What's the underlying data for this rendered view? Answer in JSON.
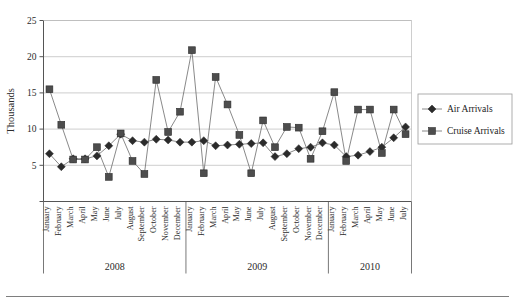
{
  "chart_data": {
    "type": "line",
    "title": "",
    "subtitle": "",
    "xlabel": "",
    "ylabel": "Thousands",
    "ylim": [
      0,
      25
    ],
    "yticks": [
      0,
      5,
      10,
      15,
      20,
      25
    ],
    "ytick_labels": [
      "",
      "5",
      "10",
      "15",
      "20",
      "25"
    ],
    "grid": true,
    "legend_position": "right",
    "x": [
      "January",
      "February",
      "March",
      "April",
      "May",
      "June",
      "July",
      "August",
      "September",
      "October",
      "November",
      "December",
      "January",
      "February",
      "March",
      "April",
      "May",
      "June",
      "July",
      "August",
      "September",
      "October",
      "November",
      "December",
      "January",
      "February",
      "March",
      "April",
      "May",
      "June",
      "July"
    ],
    "year_groups": [
      {
        "label": "2008",
        "start_index": 0,
        "count": 12
      },
      {
        "label": "2009",
        "start_index": 12,
        "count": 12
      },
      {
        "label": "2010",
        "start_index": 24,
        "count": 7
      }
    ],
    "series": [
      {
        "name": "Air Arrivals",
        "marker": "diamond",
        "color": "#2b2b2b",
        "values": [
          6.6,
          4.8,
          5.9,
          5.9,
          6.3,
          7.7,
          9.3,
          8.4,
          8.2,
          8.6,
          8.5,
          8.2,
          8.2,
          8.4,
          7.7,
          7.8,
          7.9,
          8.0,
          8.1,
          6.2,
          6.6,
          7.3,
          7.5,
          8.1,
          7.8,
          6.2,
          6.4,
          6.9,
          7.5,
          8.8,
          10.3
        ]
      },
      {
        "name": "Cruise Arrivals",
        "marker": "square",
        "color": "#4d4d4d",
        "values": [
          15.5,
          10.6,
          5.8,
          5.8,
          7.5,
          3.4,
          9.4,
          5.6,
          3.8,
          16.8,
          9.6,
          12.4,
          20.9,
          3.9,
          17.2,
          13.4,
          9.2,
          3.9,
          11.2,
          7.5,
          10.3,
          10.2,
          5.9,
          9.7,
          15.1,
          5.6,
          12.7,
          12.7,
          6.7,
          12.7,
          9.3
        ]
      }
    ]
  },
  "legend": {
    "items": [
      {
        "label": "Air Arrivals",
        "marker": "diamond"
      },
      {
        "label": "Cruise Arrivals",
        "marker": "square"
      }
    ]
  },
  "axes": {
    "y_axis_title": "Thousands"
  }
}
